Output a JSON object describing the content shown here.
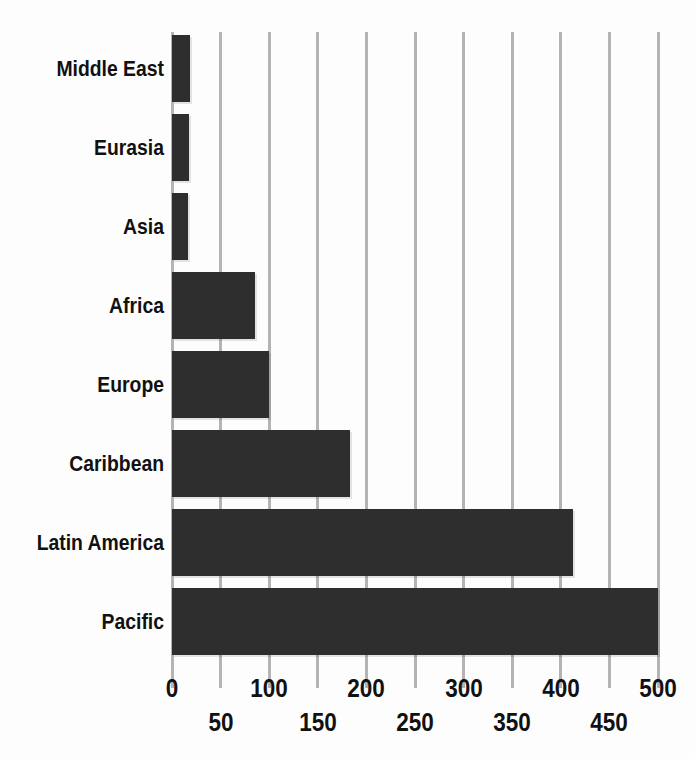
{
  "chart_data": {
    "type": "bar",
    "orientation": "horizontal",
    "title": "",
    "xlabel": "",
    "ylabel": "",
    "categories": [
      "Middle East",
      "Eurasia",
      "Asia",
      "Africa",
      "Europe",
      "Caribbean",
      "Latin America",
      "Pacific"
    ],
    "values": [
      19,
      17,
      16,
      85,
      100,
      183,
      413,
      500
    ],
    "xlim": [
      0,
      500
    ],
    "xticks": [
      0,
      50,
      100,
      150,
      200,
      250,
      300,
      350,
      400,
      450,
      500
    ],
    "xtick_labels": [
      "0",
      "50",
      "100",
      "150",
      "200",
      "250",
      "300",
      "350",
      "400",
      "450",
      "500"
    ],
    "grid": true,
    "grid_axis": "x",
    "legend": false,
    "bar_color": "#2e2e2e",
    "gridline_color": "#b4b4b4",
    "background_color": "#fdfdfd",
    "text_color": "#111111"
  }
}
